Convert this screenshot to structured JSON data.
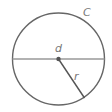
{
  "diagram": {
    "labels": {
      "circumference": "C",
      "diameter": "d",
      "radius": "r"
    },
    "colors": {
      "circle": "#666666",
      "diameter": "#999999",
      "radius": "#555555",
      "center": "#555555"
    }
  }
}
